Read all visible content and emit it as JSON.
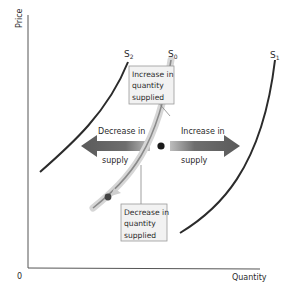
{
  "axes": {
    "y_label": "Price",
    "x_label": "Quantity",
    "origin_label": "0"
  },
  "curves": {
    "s2": {
      "label_main": "S",
      "label_sub": "2",
      "color": "#2b2b2b"
    },
    "s0": {
      "label_main": "S",
      "label_sub": "0",
      "color": "#c9c9c9"
    },
    "s1": {
      "label_main": "S",
      "label_sub": "1",
      "color": "#2b2b2b"
    }
  },
  "shift_arrows": {
    "decrease": {
      "line1": "Decrease in",
      "line2": "supply",
      "color": "#6b6b6b"
    },
    "increase": {
      "line1": "Increase in",
      "line2": "supply",
      "color": "#6b6b6b"
    }
  },
  "callouts": {
    "increase_qs": {
      "line1": "Increase in",
      "line2": "quantity",
      "line3": "supplied"
    },
    "decrease_qs": {
      "line1": "Decrease in",
      "line2": "quantity",
      "line3": "supplied"
    }
  },
  "colors": {
    "axis": "#555555",
    "point": "#1a1a1a",
    "point_on_s0": "#444444",
    "callout_bg": "#f2f2f2",
    "callout_border": "#9a9a9a"
  }
}
